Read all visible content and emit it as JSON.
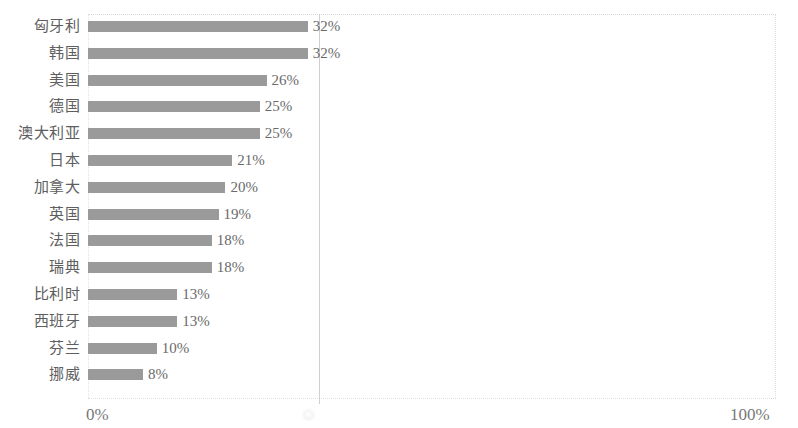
{
  "chart_data": {
    "type": "bar",
    "orientation": "horizontal",
    "title": "",
    "subtitle": "",
    "xlabel": "",
    "ylabel": "",
    "xlim": [
      0,
      100
    ],
    "grid": true,
    "legend": null,
    "value_suffix": "%",
    "categories": [
      "匈牙利",
      "韩国",
      "美国",
      "德国",
      "澳大利亚",
      "日本",
      "加拿大",
      "英国",
      "法国",
      "瑞典",
      "比利时",
      "西班牙",
      "芬兰",
      "挪威"
    ],
    "values": [
      32,
      32,
      26,
      25,
      25,
      21,
      20,
      19,
      18,
      18,
      13,
      13,
      10,
      8
    ],
    "value_labels": [
      "32%",
      "32%",
      "26%",
      "25%",
      "25%",
      "21%",
      "20%",
      "19%",
      "18%",
      "18%",
      "13%",
      "13%",
      "10%",
      "8%"
    ],
    "axis_ticks": [
      {
        "name": "min",
        "label": "0%",
        "value": 0
      },
      {
        "name": "mid",
        "label": "",
        "value": 50,
        "state": "illegible-smudge"
      },
      {
        "name": "max",
        "label": "100%",
        "value": 100
      }
    ],
    "colors": {
      "bar": "#9a9a9a",
      "value_text": "#6a6a6a",
      "category_text": "#5e5e5e",
      "tick_text": "#787878",
      "gridline": "#cfcfcf",
      "frame": "#d8d8d8",
      "background": "#ffffff"
    }
  }
}
